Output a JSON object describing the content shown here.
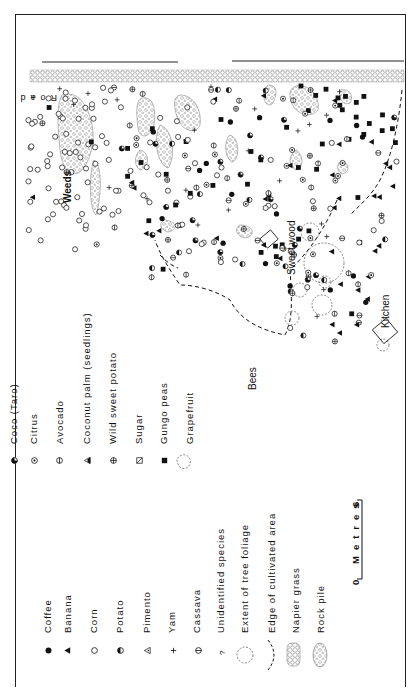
{
  "figure": {
    "orientation": "rotated 90 degrees counter-clockwise",
    "map_labels": {
      "road": "Road",
      "weeds": "Weeds",
      "bees": "Bees",
      "sweet_wood": "Sweet wood",
      "kitchen": "Kitchen"
    },
    "legend": {
      "left_column": [
        {
          "symbol": "filled-circle",
          "label": "Coffee"
        },
        {
          "symbol": "filled-triangle",
          "label": "Banana"
        },
        {
          "symbol": "open-circle",
          "label": "Corn"
        },
        {
          "symbol": "half-filled-circle",
          "label": "Potato"
        },
        {
          "symbol": "triangle-with-dot",
          "label": "Pimento"
        },
        {
          "symbol": "plus",
          "label": "Yam"
        },
        {
          "symbol": "circle-with-line",
          "label": "Cassava"
        },
        {
          "symbol": "question-mark",
          "label": "Unidentified species"
        },
        {
          "symbol": "dashed-outline-circle",
          "label": "Extent of tree foliage"
        },
        {
          "symbol": "dashed-curve",
          "label": "Edge of cultivated area"
        },
        {
          "symbol": "napier-texture",
          "label": "Napier grass"
        },
        {
          "symbol": "rock-texture",
          "label": "Rock pile"
        }
      ],
      "right_column": [
        {
          "symbol": "quarter-filled-circle",
          "label": "Coco (Taro)"
        },
        {
          "symbol": "circle-with-dot",
          "label": "Citrus"
        },
        {
          "symbol": "circle-with-bar",
          "label": "Avocado"
        },
        {
          "symbol": "half-triangle",
          "label": "Coconut palm (seedlings)"
        },
        {
          "symbol": "circle-with-cross",
          "label": "Wild sweet potato"
        },
        {
          "symbol": "square-with-slash",
          "label": "Sugar"
        },
        {
          "symbol": "filled-square",
          "label": "Gungo peas"
        },
        {
          "symbol": "outline-blob",
          "label": "Grapefruit"
        }
      ]
    },
    "scale_bar": {
      "start": "0",
      "end": "6",
      "unit": "Metres"
    },
    "colors": {
      "ink": "#111111",
      "background": "#ffffff",
      "texture": "#888888"
    }
  }
}
